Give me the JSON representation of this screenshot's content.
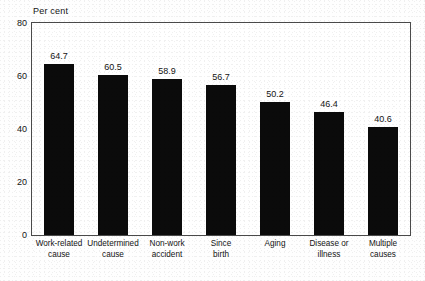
{
  "chart_data": {
    "type": "bar",
    "title": "",
    "subtitle": "",
    "xlabel": "",
    "ylabel": "Per cent",
    "ylim": [
      0,
      80
    ],
    "yticks": [
      "0",
      "20",
      "40",
      "60",
      "80"
    ],
    "grid": false,
    "legend": false,
    "bar_color": "#0b0b0b",
    "frame_color": "#4a4a4a",
    "categories": [
      "Work-related cause",
      "Undetermined cause",
      "Non-work accident",
      "Since birth",
      "Aging",
      "Disease or illness",
      "Multiple causes"
    ],
    "category_lines": [
      [
        "Work-related",
        "cause"
      ],
      [
        "Undetermined",
        "cause"
      ],
      [
        "Non-work",
        "accident"
      ],
      [
        "Since",
        "birth"
      ],
      [
        "Aging",
        ""
      ],
      [
        "Disease or",
        "illness"
      ],
      [
        "Multiple",
        "causes"
      ]
    ],
    "values": [
      64.7,
      60.5,
      58.9,
      56.7,
      50.2,
      46.4,
      40.6
    ],
    "value_labels": [
      "64.7",
      "60.5",
      "58.9",
      "56.7",
      "50.2",
      "46.4",
      "40.6"
    ]
  }
}
